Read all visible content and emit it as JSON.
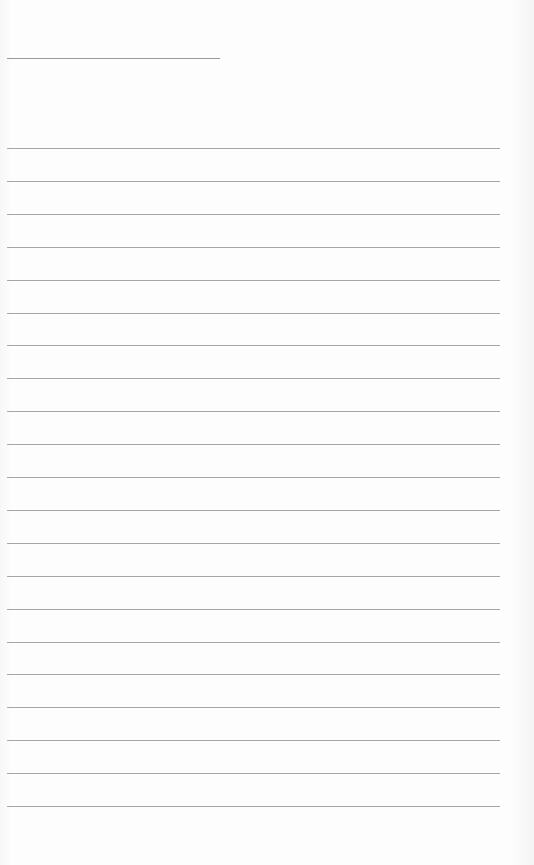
{
  "document": {
    "type": "lined-page",
    "header_field": {
      "label": "",
      "value": ""
    },
    "ruled_lines": [
      {
        "text": ""
      },
      {
        "text": ""
      },
      {
        "text": ""
      },
      {
        "text": ""
      },
      {
        "text": ""
      },
      {
        "text": ""
      },
      {
        "text": ""
      },
      {
        "text": ""
      },
      {
        "text": ""
      },
      {
        "text": ""
      },
      {
        "text": ""
      },
      {
        "text": ""
      },
      {
        "text": ""
      },
      {
        "text": ""
      },
      {
        "text": ""
      },
      {
        "text": ""
      },
      {
        "text": ""
      },
      {
        "text": ""
      },
      {
        "text": ""
      },
      {
        "text": ""
      },
      {
        "text": ""
      }
    ],
    "line_color": "#a6a6a6",
    "paper_color": "#fdfdfd"
  }
}
